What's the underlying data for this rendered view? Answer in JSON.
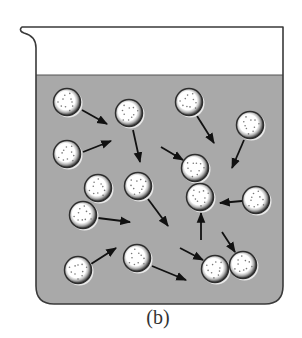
{
  "figure": {
    "caption": "(b)",
    "colors": {
      "liquid": "#a9a9a9",
      "outline": "#3a3a3a",
      "particle_rim": "#2e2e2e",
      "particle_core": "#ffffff",
      "arrow": "#111111"
    }
  },
  "particles": [
    {
      "id": "p1"
    },
    {
      "id": "p2"
    },
    {
      "id": "p3"
    },
    {
      "id": "p4"
    },
    {
      "id": "p5"
    },
    {
      "id": "p6"
    },
    {
      "id": "p7"
    },
    {
      "id": "p8"
    },
    {
      "id": "p9"
    },
    {
      "id": "p10"
    },
    {
      "id": "p11"
    },
    {
      "id": "p12"
    },
    {
      "id": "p13"
    },
    {
      "id": "p14"
    },
    {
      "id": "p15"
    }
  ],
  "arrows_count": 16
}
